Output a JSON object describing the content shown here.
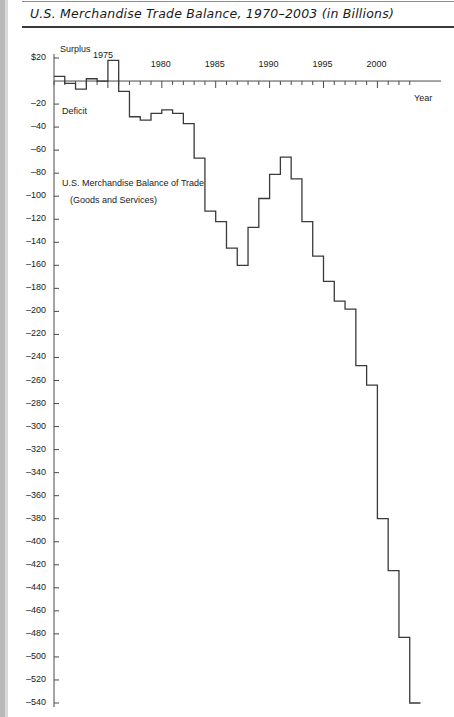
{
  "page": {
    "title": "U.S. Merchandise Trade Balance, 1970–2003 (in Billions)"
  },
  "annotations": {
    "surplus": "Surplus",
    "deficit": "Deficit",
    "series_label_line1": "U.S. Merchandise Balance of Trade",
    "series_label_line2": "(Goods and Services)",
    "year_axis_label": "Year",
    "peak_year_label": "1975"
  },
  "colors": {
    "line": "#3a3a3a",
    "axis": "#4a4a4a",
    "text": "#1a1a1a",
    "page_edge": "#b9b9b9"
  },
  "chart_data": {
    "type": "line",
    "title": "U.S. Merchandise Trade Balance, 1970–2003 (in Billions)",
    "subtitle": "U.S. Merchandise Balance of Trade (Goods and Services)",
    "xlabel": "Year",
    "ylabel": "",
    "grid": false,
    "legend": "none",
    "step": "post",
    "xlim": [
      1970,
      2003
    ],
    "ylim": [
      -540,
      20
    ],
    "xticks": [
      1970,
      1971,
      1972,
      1973,
      1974,
      1975,
      1976,
      1977,
      1978,
      1979,
      1980,
      1981,
      1982,
      1983,
      1984,
      1985,
      1986,
      1987,
      1988,
      1989,
      1990,
      1991,
      1992,
      1993,
      1994,
      1995,
      1996,
      1997,
      1998,
      1999,
      2000,
      2001,
      2002,
      2003
    ],
    "xtick_labels": [
      "1975",
      "1980",
      "1985",
      "1990",
      "1995",
      "2000"
    ],
    "xtick_labeled_years": [
      1975,
      1980,
      1985,
      1990,
      1995,
      2000
    ],
    "ytick_labels": [
      "$20",
      "–20",
      "–40",
      "–60",
      "–80",
      "–100",
      "–120",
      "–140",
      "–160",
      "–180",
      "–200",
      "–220",
      "–240",
      "–260",
      "–280",
      "–300",
      "–320",
      "–340",
      "–360",
      "–380",
      "–400",
      "–420",
      "–440",
      "–460",
      "–480",
      "–500",
      "–520",
      "–540"
    ],
    "yticks": [
      20,
      -20,
      -40,
      -60,
      -80,
      -100,
      -120,
      -140,
      -160,
      -180,
      -200,
      -220,
      -240,
      -260,
      -280,
      -300,
      -320,
      -340,
      -360,
      -380,
      -400,
      -420,
      -440,
      -460,
      -480,
      -500,
      -520,
      -540
    ],
    "x": [
      1970,
      1971,
      1972,
      1973,
      1974,
      1975,
      1976,
      1977,
      1978,
      1979,
      1980,
      1981,
      1982,
      1983,
      1984,
      1985,
      1986,
      1987,
      1988,
      1989,
      1990,
      1991,
      1992,
      1993,
      1994,
      1995,
      1996,
      1997,
      1998,
      1999,
      2000,
      2001,
      2002,
      2003
    ],
    "values": [
      4,
      -2,
      -7,
      2,
      0,
      18,
      -9,
      -31,
      -34,
      -28,
      -25,
      -28,
      -37,
      -67,
      -113,
      -122,
      -145,
      -160,
      -127,
      -102,
      -81,
      -66,
      -85,
      -122,
      -152,
      -174,
      -191,
      -198,
      -247,
      -264,
      -380,
      -425,
      -483,
      -540
    ],
    "series": [
      {
        "name": "U.S. Merchandise Balance of Trade (Goods and Services)",
        "values": [
          4,
          -2,
          -7,
          2,
          0,
          18,
          -9,
          -31,
          -34,
          -28,
          -25,
          -28,
          -37,
          -67,
          -113,
          -122,
          -145,
          -160,
          -127,
          -102,
          -81,
          -66,
          -85,
          -122,
          -152,
          -174,
          -191,
          -198,
          -247,
          -264,
          -380,
          -425,
          -483,
          -540
        ]
      }
    ],
    "units": "Billions of U.S. dollars",
    "zero_line": 0
  }
}
